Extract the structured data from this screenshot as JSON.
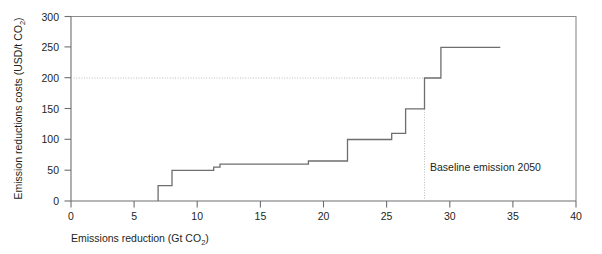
{
  "chart_data": {
    "type": "line",
    "subtype": "step",
    "title": "",
    "xlabel": "Emissions reduction (Gt CO2)",
    "xlabel_pre": "Emissions reduction (Gt CO",
    "xlabel_sub": "2",
    "xlabel_post": ")",
    "ylabel": "Emission reductions costs (USD/t CO2)",
    "ylabel_pre": "Emission reductions costs (USD/t CO",
    "ylabel_sub": "2",
    "ylabel_post": ")",
    "xlim": [
      0,
      40
    ],
    "ylim": [
      0,
      300
    ],
    "xticks": [
      0,
      5,
      10,
      15,
      20,
      25,
      30,
      35,
      40
    ],
    "xtick_labels": [
      "0",
      "5",
      "10",
      "15",
      "20",
      "25",
      "30",
      "35",
      "40"
    ],
    "yticks": [
      0,
      50,
      100,
      150,
      200,
      250,
      300
    ],
    "ytick_labels": [
      "0",
      "50",
      "100",
      "150",
      "200",
      "250",
      "300"
    ],
    "grid": false,
    "legend": null,
    "series": [
      {
        "name": "Marginal abatement cost curve",
        "color": "#6d6e71",
        "step_points": [
          {
            "x": 6.9,
            "y": 0
          },
          {
            "x": 6.9,
            "y": 25
          },
          {
            "x": 8.0,
            "y": 25
          },
          {
            "x": 8.0,
            "y": 50
          },
          {
            "x": 11.3,
            "y": 50
          },
          {
            "x": 11.3,
            "y": 55
          },
          {
            "x": 11.8,
            "y": 55
          },
          {
            "x": 11.8,
            "y": 60
          },
          {
            "x": 18.8,
            "y": 60
          },
          {
            "x": 18.8,
            "y": 65
          },
          {
            "x": 21.9,
            "y": 65
          },
          {
            "x": 21.9,
            "y": 100
          },
          {
            "x": 25.4,
            "y": 100
          },
          {
            "x": 25.4,
            "y": 110
          },
          {
            "x": 26.5,
            "y": 110
          },
          {
            "x": 26.5,
            "y": 150
          },
          {
            "x": 28.0,
            "y": 150
          },
          {
            "x": 28.0,
            "y": 200
          },
          {
            "x": 29.3,
            "y": 200
          },
          {
            "x": 29.3,
            "y": 250
          },
          {
            "x": 34.0,
            "y": 250
          }
        ]
      }
    ],
    "annotations": [
      {
        "name": "baseline-emission-2050",
        "label": "Baseline emission 2050",
        "x": 28.0,
        "y_guide": 200,
        "style": "dotted-crosshair",
        "color": "#b9bbbd"
      }
    ]
  }
}
